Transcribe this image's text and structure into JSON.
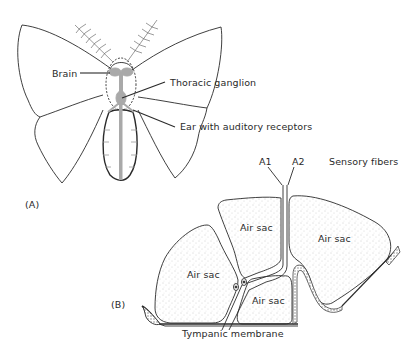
{
  "figure": {
    "panel_a": {
      "tag": "(A)",
      "subject": "moth",
      "labels": {
        "brain": "Brain",
        "thoracic_ganglion": "Thoracic ganglion",
        "ear": "Ear with auditory receptors"
      }
    },
    "panel_b": {
      "tag": "(B)",
      "labels": {
        "a1": "A1",
        "a2": "A2",
        "sensory_fibers": "Sensory fibers",
        "air_sac_top": "Air sac",
        "air_sac_right": "Air sac",
        "air_sac_left": "Air sac",
        "air_sac_bottom": "Air sac",
        "tympanic_membrane": "Tympanic membrane"
      }
    },
    "colors": {
      "line": "#2a2a2a",
      "nervous_system": "#a9a9a9",
      "stipple": "#9a9a9a"
    }
  }
}
